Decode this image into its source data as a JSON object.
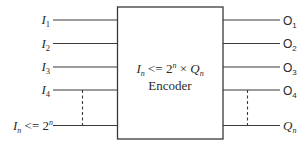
{
  "diagram": {
    "type": "block-diagram",
    "block": {
      "formula": {
        "lhs_base": "I",
        "lhs_sub": "n",
        "operator": " <= 2",
        "exp": "n",
        "times": " × ",
        "rhs_base": "Q",
        "rhs_sub": "n"
      },
      "label": "Encoder"
    },
    "inputs": [
      {
        "base": "I",
        "sub": "1"
      },
      {
        "base": "I",
        "sub": "2"
      },
      {
        "base": "I",
        "sub": "3"
      },
      {
        "base": "I",
        "sub": "4"
      },
      {
        "base": "I",
        "sub": "n",
        "suffix": " <= 2",
        "exp": "n"
      }
    ],
    "outputs": [
      {
        "base": "O",
        "sub": "1"
      },
      {
        "base": "O",
        "sub": "2"
      },
      {
        "base": "O",
        "sub": "3"
      },
      {
        "base": "O",
        "sub": "4"
      },
      {
        "base": "Q",
        "sub": "n"
      }
    ]
  }
}
